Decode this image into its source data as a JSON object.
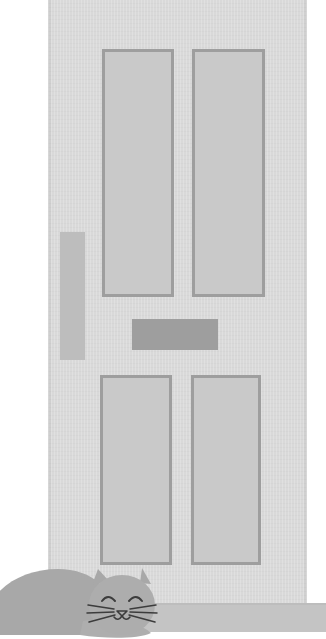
{
  "scene": {
    "title": "Sleeping cat in front of a panelled door",
    "caption": "Grayscale flat illustration of a four-panel front door with a grey cat curled up asleep on the floor in front of it.",
    "width": 326,
    "height": 639,
    "background_color": "#ffffff"
  },
  "palette": {
    "background": "#ffffff",
    "door_face": "#d9d9d9",
    "panel_fill": "#c9c9c9",
    "panel_border": "#9e9e9e",
    "mail_slot": "#9e9e9e",
    "handle_plate": "#bdbdbd",
    "floor": "#c4c4c4",
    "cat_body": "#a8a8a8",
    "cat_outline": "#3c3c3c"
  },
  "door": {
    "name": "front-door",
    "label": "Panelled front door",
    "x": 48,
    "y": 0,
    "width": 259,
    "height": 612,
    "panels": [
      {
        "name": "panel-top-left",
        "label": "Top left panel",
        "x": 102,
        "y": 49,
        "width": 72,
        "height": 248
      },
      {
        "name": "panel-top-right",
        "label": "Top right panel",
        "x": 192,
        "y": 49,
        "width": 73,
        "height": 248
      },
      {
        "name": "panel-bottom-left",
        "label": "Bottom left panel",
        "x": 100,
        "y": 375,
        "width": 72,
        "height": 190
      },
      {
        "name": "panel-bottom-right",
        "label": "Bottom right panel",
        "x": 191,
        "y": 375,
        "width": 70,
        "height": 190
      }
    ],
    "hardware": [
      {
        "name": "handle-plate",
        "label": "Vertical door handle plate",
        "x": 60,
        "y": 232,
        "width": 25,
        "height": 128
      },
      {
        "name": "mail-slot",
        "label": "Letter box / mail slot",
        "x": 132,
        "y": 319,
        "width": 86,
        "height": 31
      }
    ]
  },
  "floor": {
    "name": "floor-strip",
    "label": "Floor / threshold",
    "y": 605,
    "height": 27
  },
  "cat": {
    "name": "sleeping-cat",
    "label": "Sleeping grey cat",
    "pose": "curled up, eyes closed",
    "x": -12,
    "y": 563,
    "width": 190,
    "height": 76,
    "features": {
      "eyes": "two closed curved arcs",
      "nose": "small triangle",
      "mouth": "w-shaped line",
      "whiskers_per_side": 3,
      "ears": 2
    }
  }
}
